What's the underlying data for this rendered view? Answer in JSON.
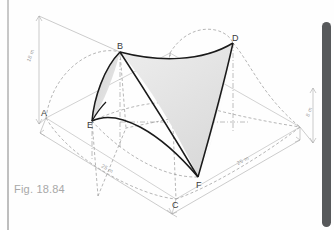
{
  "figure": {
    "caption": "Fig. 18.84",
    "type": "hyperbolic-paraboloid-roof",
    "vertices": [
      {
        "id": "A",
        "label": "A",
        "x": 46,
        "y": 118
      },
      {
        "id": "B",
        "label": "B",
        "x": 120,
        "y": 52
      },
      {
        "id": "C",
        "label": "C",
        "x": 176,
        "y": 199
      },
      {
        "id": "D",
        "label": "D",
        "x": 233,
        "y": 43
      },
      {
        "id": "E",
        "label": "E",
        "x": 92,
        "y": 121
      },
      {
        "id": "F",
        "label": "F",
        "x": 198,
        "y": 177
      }
    ],
    "dimensions": [
      {
        "id": "height-left",
        "label": "18 m",
        "x": 30,
        "y": 62,
        "rotate": -70
      },
      {
        "id": "height-right",
        "label": "8 m",
        "x": 309,
        "y": 117,
        "rotate": -70
      },
      {
        "id": "base-left",
        "label": "25 m",
        "x": 101,
        "y": 167,
        "rotate": 29
      },
      {
        "id": "base-right",
        "label": "25 m",
        "x": 238,
        "y": 165,
        "rotate": -27
      }
    ],
    "colors": {
      "outline": "#1a1a1a",
      "construction": "#8e8e8e",
      "dimension": "#a9a9a9",
      "surface_light": "#f0f0f0",
      "surface_dark": "#d9d9d9",
      "caption": "#a8a8a8",
      "scrollbar": "#57595b",
      "background": "#fefefe"
    }
  },
  "scrollbar": {
    "name": "vertical-scrollbar"
  }
}
